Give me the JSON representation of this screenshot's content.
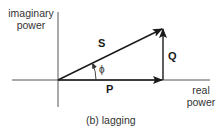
{
  "diagram": {
    "type": "power-triangle",
    "y_axis_label": {
      "line1": "imaginary",
      "line2": "power"
    },
    "x_axis_label": {
      "line1": "real",
      "line2": "power"
    },
    "vectors": {
      "S": {
        "label": "S",
        "description": "apparent power"
      },
      "P": {
        "label": "P",
        "description": "real power"
      },
      "Q": {
        "label": "Q",
        "description": "reactive power"
      }
    },
    "angle_label": "ϕ",
    "caption": "(b) lagging",
    "colors": {
      "line": "#1a1a1a",
      "axis": "#555555",
      "text": "#333333",
      "background": "#ffffff"
    }
  }
}
